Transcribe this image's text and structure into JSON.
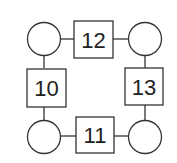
{
  "diagram": {
    "circles": [
      {
        "id": "top-left",
        "value": ""
      },
      {
        "id": "top-right",
        "value": ""
      },
      {
        "id": "bottom-left",
        "value": ""
      },
      {
        "id": "bottom-right",
        "value": ""
      }
    ],
    "boxes": {
      "top": "12",
      "left": "10",
      "right": "13",
      "bottom": "11"
    }
  }
}
